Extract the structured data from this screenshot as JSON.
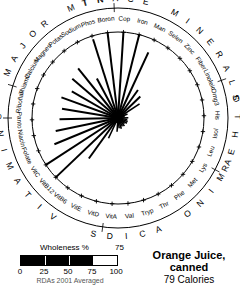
{
  "title": {
    "name_line1": "Orange Juice,",
    "name_line2": "canned",
    "calories": "79 Calories"
  },
  "legend": {
    "bar_label": "Wholeness %",
    "bar_value": "75",
    "ticks": [
      "0",
      "25",
      "50",
      "75",
      "100"
    ],
    "footnote": "RDAs 2001 Averaged"
  },
  "groups": [
    {
      "name": "MAJOR MIN",
      "label": "MAJOR MIN"
    },
    {
      "name": "TRACE MINERALS",
      "label": "TRACE MINERALS"
    },
    {
      "name": "OTHER",
      "label": "OTHER"
    },
    {
      "name": "AMINO ACIDS",
      "label": "AMINO ACIDS"
    },
    {
      "name": "VITAMINS",
      "label": "VITAMINS"
    }
  ],
  "chart_data": {
    "type": "radar",
    "title": "Orange Juice, canned",
    "subtitle": "79 Calories",
    "value_label": "Wholeness %",
    "value": 75,
    "rmin": 0,
    "rmax": 100,
    "grid": false,
    "note": "RDAs 2001 Averaged",
    "categories": [
      "Calcium",
      "Magnes",
      "Potas",
      "Sodium",
      "Phos",
      "Boron",
      "Cop",
      "Iron",
      "Man",
      "Selen",
      "Zinc",
      "Fiber",
      "Linoleic",
      "Omg3",
      "His",
      "Isol",
      "Leu",
      "Lys",
      "Met",
      "Phe",
      "Thr",
      "Tryp",
      "Val",
      "VitA",
      "VitD",
      "VitE",
      "VitB6",
      "VitB12",
      "VitC",
      "Folate",
      "Niacin",
      "Panto",
      "Riboflav",
      "Thiamin"
    ],
    "values": [
      62,
      70,
      74,
      52,
      96,
      100,
      100,
      100,
      84,
      40,
      36,
      30,
      12,
      8,
      12,
      11,
      12,
      12,
      10,
      12,
      11,
      13,
      12,
      16,
      6,
      26,
      58,
      100,
      100,
      80,
      74,
      68,
      66,
      70
    ],
    "group_spans": [
      {
        "label": "MAJOR MIN",
        "from": "Calcium",
        "to": "Phos"
      },
      {
        "label": "TRACE MINERALS",
        "from": "Boron",
        "to": "Zinc"
      },
      {
        "label": "OTHER",
        "from": "Fiber",
        "to": "Omg3"
      },
      {
        "label": "AMINO ACIDS",
        "from": "His",
        "to": "Val"
      },
      {
        "label": "VITAMINS",
        "from": "VitA",
        "to": "Thiamin"
      }
    ]
  }
}
